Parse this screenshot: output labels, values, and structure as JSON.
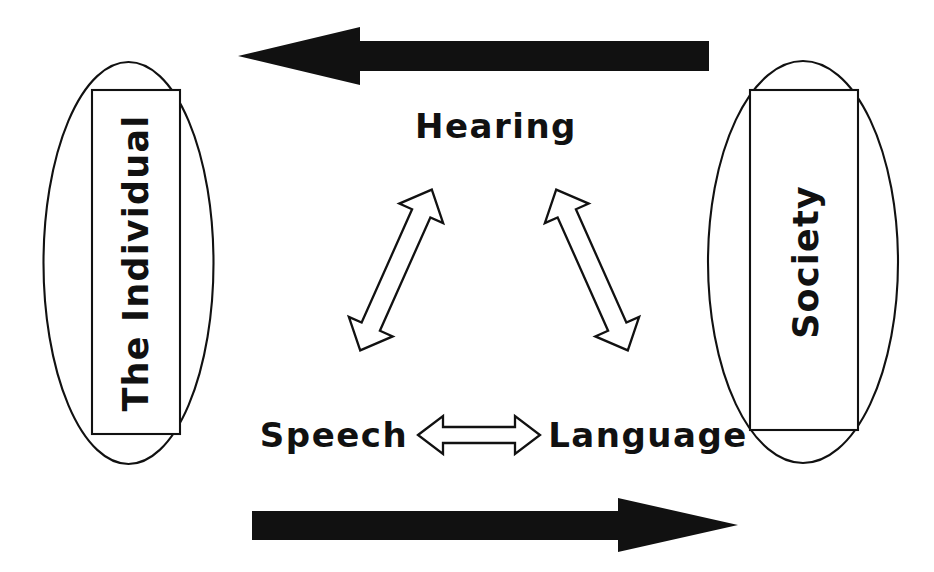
{
  "diagram": {
    "background_color": "#ffffff",
    "ink_color": "#111111",
    "nodes": {
      "left": {
        "label": "The Individual",
        "orientation": "rotated-90-ccw",
        "shape": "ellipse-with-rectangle"
      },
      "right": {
        "label": "Society",
        "orientation": "rotated-90-ccw",
        "shape": "ellipse-with-rectangle"
      },
      "top_center": {
        "label": "Hearing"
      },
      "bottom_left": {
        "label": "Speech"
      },
      "bottom_right": {
        "label": "Language"
      }
    },
    "connectors": {
      "top_arrow": {
        "name": "society-to-individual-arrow",
        "direction": "left",
        "style": "solid-filled",
        "from": "Society",
        "to": "The Individual"
      },
      "bottom_arrow": {
        "name": "individual-to-society-arrow",
        "direction": "right",
        "style": "solid-filled",
        "from": "The Individual",
        "to": "Society"
      },
      "speech_hearing_arrow": {
        "name": "speech-hearing-arrow",
        "direction": "bidirectional",
        "style": "hollow-outline",
        "from": "Speech",
        "to": "Hearing"
      },
      "hearing_language_arrow": {
        "name": "hearing-language-arrow",
        "direction": "bidirectional",
        "style": "hollow-outline",
        "from": "Hearing",
        "to": "Language"
      },
      "speech_language_arrow": {
        "name": "speech-language-arrow",
        "direction": "bidirectional",
        "style": "hollow-outline",
        "from": "Speech",
        "to": "Language"
      }
    }
  }
}
